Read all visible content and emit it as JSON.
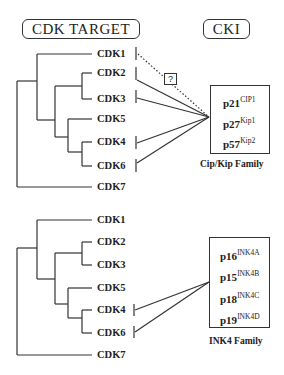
{
  "headers": {
    "left": "CDK TARGET",
    "right": "CKI"
  },
  "question_mark": "?",
  "top_panel": {
    "cdks": [
      "CDK1",
      "CDK2",
      "CDK3",
      "CDK5",
      "CDK4",
      "CDK6",
      "CDK7"
    ],
    "inhibitors": [
      {
        "name": "p21",
        "sup": "CIP1"
      },
      {
        "name": "p27",
        "sup": "Kip1"
      },
      {
        "name": "p57",
        "sup": "Kip2"
      }
    ],
    "family_label": "Cip/Kip Family",
    "targets": [
      "CDK2",
      "CDK3",
      "CDK4",
      "CDK6"
    ],
    "uncertain_target": "CDK1"
  },
  "bottom_panel": {
    "cdks": [
      "CDK1",
      "CDK2",
      "CDK3",
      "CDK5",
      "CDK4",
      "CDK6",
      "CDK7"
    ],
    "inhibitors": [
      {
        "name": "p16",
        "sup": "INK4A"
      },
      {
        "name": "p15",
        "sup": "INK4B"
      },
      {
        "name": "p18",
        "sup": "INK4C"
      },
      {
        "name": "p19",
        "sup": "INK4D"
      }
    ],
    "family_label": "INK4 Family",
    "targets": [
      "CDK4",
      "CDK6"
    ]
  },
  "colors": {
    "line": "#333333",
    "background": "#ffffff"
  }
}
